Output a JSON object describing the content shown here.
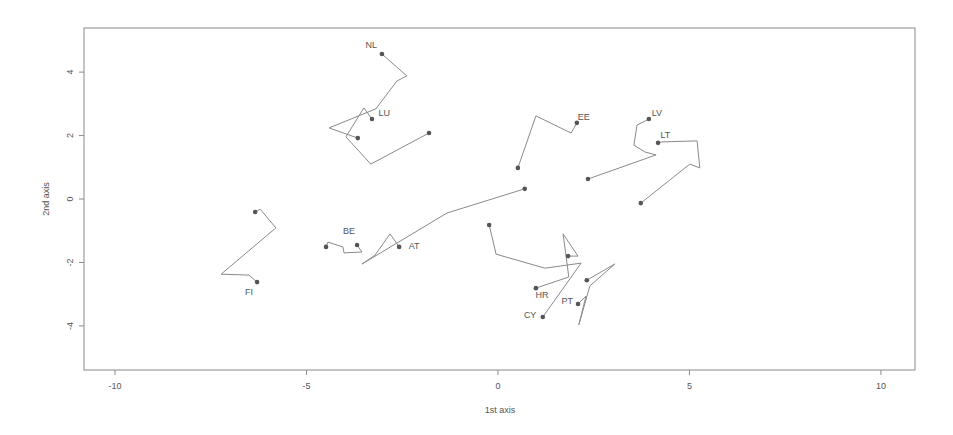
{
  "chart_data": {
    "type": "line",
    "title": "",
    "xlabel": "1st axis",
    "ylabel": "2nd axis",
    "xlim": [
      -10.81,
      10.89
    ],
    "ylim": [
      -5.39,
      5.39
    ],
    "x_ticks": [
      -10,
      -5,
      0,
      5,
      10
    ],
    "y_ticks": [
      -4,
      -2,
      0,
      2,
      4
    ],
    "grid": false,
    "legend": null,
    "series": [
      {
        "name": "NL",
        "label_at": 0,
        "x": [
          -3.03,
          -2.38,
          -2.64,
          -3.19,
          -4.41,
          -3.66
        ],
        "y": [
          4.57,
          3.88,
          3.72,
          2.84,
          2.24,
          1.92
        ]
      },
      {
        "name": "LU",
        "label_at": 0,
        "x": [
          -3.29,
          -3.5,
          -3.97,
          -3.32,
          -1.8
        ],
        "y": [
          2.52,
          2.87,
          1.96,
          1.1,
          2.08
        ]
      },
      {
        "name": "EE",
        "label_at": 0,
        "x": [
          2.06,
          1.91,
          0.99,
          0.52
        ],
        "y": [
          2.4,
          2.08,
          2.62,
          0.98
        ]
      },
      {
        "name": "LV",
        "label_at": 0,
        "x": [
          3.94,
          3.63,
          3.55,
          3.84,
          4.13,
          2.35
        ],
        "y": [
          2.52,
          2.33,
          1.7,
          1.48,
          1.39,
          0.63
        ]
      },
      {
        "name": "LT",
        "label_at": 0,
        "x": [
          4.18,
          4.28,
          5.2,
          5.27,
          5.01,
          3.73
        ],
        "y": [
          1.77,
          1.8,
          1.83,
          0.98,
          1.1,
          -0.13
        ]
      },
      {
        "name": "FI",
        "label_at": 5,
        "x": [
          -6.34,
          -6.21,
          -5.8,
          -7.23,
          -6.5,
          -6.29
        ],
        "y": [
          -0.41,
          -0.32,
          -0.91,
          -2.37,
          -2.4,
          -2.62
        ]
      },
      {
        "name": "BE",
        "label_at": 5,
        "x": [
          -4.49,
          -4.44,
          -4.05,
          -4.02,
          -3.55,
          -3.68
        ],
        "y": [
          -1.51,
          -1.36,
          -1.51,
          -1.7,
          -1.67,
          -1.45
        ]
      },
      {
        "name": "AT",
        "label_at": 0,
        "x": [
          -2.58,
          -2.82,
          -3.21,
          -3.55,
          -1.33,
          0.7
        ],
        "y": [
          -1.51,
          -1.1,
          -1.77,
          -2.05,
          -0.44,
          0.32
        ]
      },
      {
        "name": "CY",
        "label_at": 4,
        "x": [
          -0.23,
          -0.05,
          1.23,
          2.17,
          1.17
        ],
        "y": [
          -0.82,
          -1.74,
          -2.18,
          -2.02,
          -3.72
        ]
      },
      {
        "name": "HR",
        "label_at": 0,
        "x": [
          0.99,
          1.85,
          1.7,
          2.09,
          1.83
        ],
        "y": [
          -2.81,
          -2.46,
          -1.1,
          -1.8,
          -1.8
        ]
      },
      {
        "name": "PT",
        "label_at": 5,
        "x": [
          2.32,
          3.05,
          2.4,
          2.11,
          2.3,
          2.09
        ],
        "y": [
          -2.56,
          -2.05,
          -2.74,
          -3.97,
          -3.06,
          -3.31
        ]
      }
    ],
    "labels": [
      {
        "text": "NL",
        "x": -3.31,
        "y": 4.82
      },
      {
        "text": "LU",
        "x": -2.97,
        "y": 2.68
      },
      {
        "text": "EE",
        "x": 2.24,
        "y": 2.56
      },
      {
        "text": "LV",
        "x": 4.15,
        "y": 2.68
      },
      {
        "text": "LT",
        "x": 4.37,
        "y": 1.99
      },
      {
        "text": "FI",
        "x": -6.5,
        "y": -2.94
      },
      {
        "text": "BE",
        "x": -3.89,
        "y": -1.04
      },
      {
        "text": "AT",
        "x": -2.19,
        "y": -1.51
      },
      {
        "text": "HR",
        "x": 1.15,
        "y": -3.03
      },
      {
        "text": "CY",
        "x": 0.84,
        "y": -3.69
      },
      {
        "text": "PT",
        "x": 1.81,
        "y": -3.22
      }
    ]
  },
  "axes": {
    "xlabel": "1st axis",
    "ylabel": "2nd axis",
    "x_tick_labels": [
      "-10",
      "-5",
      "0",
      "5",
      "10"
    ],
    "y_tick_labels": [
      "-4",
      "-2",
      "0",
      "2",
      "4"
    ]
  },
  "style": {
    "line_color": "#8a8a8a",
    "dot_color": "#555555",
    "frame_color": "#8a8a8a",
    "text_color": "#555555"
  }
}
